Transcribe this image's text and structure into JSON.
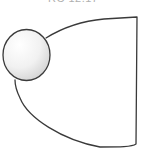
{
  "caption": {
    "text": "RC 12.17",
    "note": "partially cropped at top edge"
  },
  "diagram": {
    "shapes": [
      {
        "type": "sphere",
        "name": "ball",
        "cx": 26,
        "cy": 55,
        "r": 24
      },
      {
        "type": "outline",
        "name": "cone-body",
        "right_edge_x": 136
      }
    ],
    "colors": {
      "stroke": "#3a3a3a",
      "sphere_light": "#ffffff",
      "sphere_shade": "#d9d9d9",
      "background": "#ffffff"
    }
  }
}
